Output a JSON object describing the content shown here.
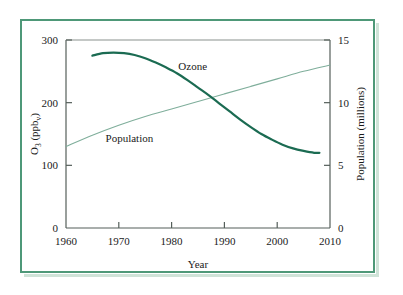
{
  "figure": {
    "frame_color": "#4e9878",
    "background": "#ffffff"
  },
  "chart_data": {
    "type": "line",
    "title": "",
    "xlabel": "Year",
    "ylabel": "O3 (ppbv)",
    "ylabel_main": "O",
    "ylabel_sub": "3",
    "ylabel_rest": " (ppb",
    "ylabel_sub2": "v",
    "ylabel_close": ")",
    "y2label": "Population (millions)",
    "xlim": [
      1960,
      2010
    ],
    "ylim": [
      0,
      300
    ],
    "y2lim": [
      0,
      15
    ],
    "xticks": [
      1960,
      1970,
      1980,
      1990,
      2000,
      2010
    ],
    "xticklabels": [
      "1960",
      "1970",
      "1980",
      "1990",
      "2000",
      "2010"
    ],
    "yticks": [
      0,
      100,
      200,
      300
    ],
    "yticklabels": [
      "0",
      "100",
      "200",
      "300"
    ],
    "y2ticks": [
      0,
      5,
      10,
      15
    ],
    "y2ticklabels": [
      "0",
      "5",
      "10",
      "15"
    ],
    "grid": false,
    "legend_position": "inline-annotations",
    "series": [
      {
        "name": "Ozone",
        "label": "Ozone",
        "axis": "left",
        "color": "#1b6b52",
        "width": 2.2,
        "x": [
          1965,
          1967,
          1969,
          1971,
          1973,
          1975,
          1977,
          1979,
          1981,
          1983,
          1985,
          1987,
          1989,
          1991,
          1993,
          1995,
          1997,
          1999,
          2001,
          2003,
          2005,
          2007,
          2008
        ],
        "values": [
          275,
          279,
          280,
          279,
          276,
          271,
          264,
          256,
          247,
          236,
          224,
          212,
          199,
          186,
          173,
          161,
          150,
          141,
          133,
          127,
          123,
          120,
          120
        ]
      },
      {
        "name": "Population",
        "label": "Population",
        "axis": "right",
        "color": "#7fae9b",
        "width": 1.1,
        "x": [
          1960,
          1965,
          1970,
          1975,
          1980,
          1985,
          1990,
          1995,
          2000,
          2005,
          2010
        ],
        "values": [
          6.5,
          7.4,
          8.2,
          8.9,
          9.5,
          10.1,
          10.7,
          11.3,
          11.9,
          12.5,
          13.0
        ]
      }
    ],
    "annotations": [
      {
        "text": "Ozone",
        "x": 1984,
        "y": 252,
        "axis": "left"
      },
      {
        "text": "Population",
        "x": 1972,
        "y": 138,
        "axis": "left"
      }
    ]
  }
}
